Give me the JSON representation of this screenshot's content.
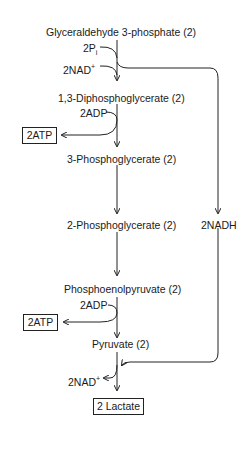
{
  "diagram": {
    "metabolites": [
      {
        "id": "g3p",
        "label": "Glyceraldehyde 3-phosphate (2)"
      },
      {
        "id": "dpg",
        "label": "1,3-Diphosphoglycerate (2)"
      },
      {
        "id": "3pg",
        "label": "3-Phosphoglycerate (2)"
      },
      {
        "id": "2pg",
        "label": "2-Phosphoglycerate (2)"
      },
      {
        "id": "pep",
        "label": "Phosphoenolpyruvate (2)"
      },
      {
        "id": "pyr",
        "label": "Pyruvate (2)"
      }
    ],
    "cofactors": {
      "pi": {
        "main": "2P",
        "sub": "i"
      },
      "nad_in": {
        "main": "2NAD",
        "sup": "+"
      },
      "adp1": "2ADP",
      "adp2": "2ADP",
      "nadh": "2NADH",
      "nad_out": {
        "main": "2NAD",
        "sup": "+"
      }
    },
    "products": {
      "atp1": "2ATP",
      "atp2": "2ATP",
      "lactate": "2 Lactate"
    }
  }
}
